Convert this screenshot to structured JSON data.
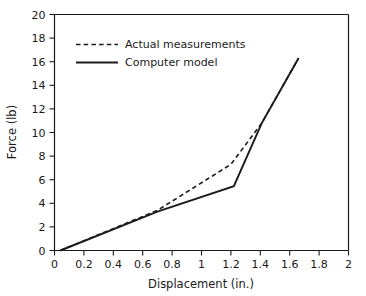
{
  "chart_data": {
    "type": "line",
    "title": "",
    "xlabel": "Displacement (in.)",
    "ylabel": "Force (lb)",
    "xlim": [
      0,
      2
    ],
    "ylim": [
      0,
      20
    ],
    "xticks": [
      "0",
      "0.2",
      "0.4",
      "0.6",
      "0.8",
      "1",
      "1.2",
      "1.4",
      "1.6",
      "1.8",
      "2"
    ],
    "xtick_values": [
      0,
      0.2,
      0.4,
      0.6,
      0.8,
      1.0,
      1.2,
      1.4,
      1.6,
      1.8,
      2.0
    ],
    "yticks": [
      "0",
      "2",
      "4",
      "6",
      "8",
      "10",
      "12",
      "14",
      "16",
      "18",
      "20"
    ],
    "ytick_values": [
      0,
      2,
      4,
      6,
      8,
      10,
      12,
      14,
      16,
      18,
      20
    ],
    "grid": false,
    "legend_position": "upper-left-inside",
    "series": [
      {
        "name": "Actual measurements",
        "style": "dashed",
        "color": "#1a1a1a",
        "x": [
          0.04,
          0.7,
          1.2,
          1.41,
          1.66
        ],
        "y": [
          0.0,
          3.4,
          7.3,
          10.8,
          16.3
        ]
      },
      {
        "name": "Computer model",
        "style": "solid",
        "color": "#1a1a1a",
        "x": [
          0.04,
          0.7,
          1.22,
          1.41,
          1.66
        ],
        "y": [
          0.0,
          3.3,
          5.45,
          10.8,
          16.3
        ]
      }
    ]
  },
  "legend": {
    "items": [
      {
        "label": "Actual measurements",
        "style": "dashed"
      },
      {
        "label": "Computer model",
        "style": "solid"
      }
    ]
  },
  "axes": {
    "x_title": "Displacement (in.)",
    "y_title": "Force (lb)"
  }
}
